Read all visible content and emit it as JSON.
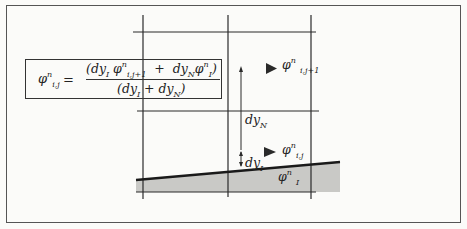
{
  "diagram": {
    "title": "",
    "formula": {
      "lhs_html": "φ<sup>n</sup><sub>i,j</sub>",
      "equals": "=",
      "numerator_html": "(dy<sub>I</sub> φ<sup>n</sup><sub>i,j+1</sub> &nbsp;+&nbsp; dy<sub>N</sub>φ<sup>n</sup><sub>I</sub>)",
      "denominator_html": "(dy<sub>I</sub> + dy<sub>N</sub>)",
      "text": "phi^n_{i,j} = (dy_I phi^n_{i,j+1} + dy_N phi^n_I) / (dy_I + dy_N)"
    },
    "labels": {
      "phi_upper_html": "φ<sup>n</sup> <sub>i,j+1</sub>",
      "phi_upper_text": "phi^n_{i,j+1}",
      "dyN_html": "dy<sub>N</sub>",
      "dyN_text": "dy_N",
      "phi_cell_html": "φ<sup>n</sup><sub>i,j</sub>",
      "phi_cell_text": "phi^n_{i,j}",
      "dyI_html": "dy<sub>I</sub>",
      "dyI_text": "dy_I",
      "phi_interface_html": "φ<sup>n</sup> <sub>I</sub>",
      "phi_interface_text": "phi^n_I"
    },
    "grid": {
      "vertical_lines_x": [
        143,
        228,
        311
      ],
      "horizontal_lines_y": [
        32,
        111,
        192
      ]
    },
    "colors": {
      "line": "#2a2a2a",
      "shaded_region": "#c9c9c6",
      "background": "#fbfbf9"
    }
  }
}
